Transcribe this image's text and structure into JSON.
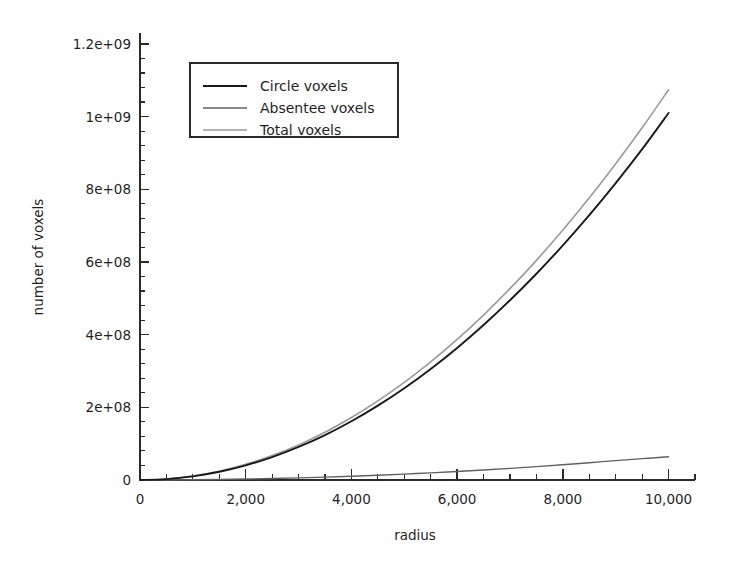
{
  "chart_data": {
    "type": "line",
    "title": "",
    "xlabel": "radius",
    "ylabel": "number of voxels",
    "xlim": [
      0,
      10500
    ],
    "ylim": [
      0,
      1230000000
    ],
    "grid": false,
    "legend_position": "upper left",
    "x_ticks": [
      0,
      2000,
      4000,
      6000,
      8000,
      10000
    ],
    "x_tick_labels": [
      "0",
      "2,000",
      "4,000",
      "6,000",
      "8,000",
      "10,000"
    ],
    "x_minor_per_major": 4,
    "y_ticks": [
      0,
      200000000,
      400000000,
      600000000,
      800000000,
      1000000000,
      1200000000
    ],
    "y_tick_labels": [
      "0",
      "2e+08",
      "4e+08",
      "6e+08",
      "8e+08",
      "1e+09",
      "1.2e+09"
    ],
    "y_minor_per_major": 5,
    "x": [
      0,
      500,
      1000,
      1500,
      2000,
      2500,
      3000,
      3500,
      4000,
      4500,
      5000,
      5500,
      6000,
      6500,
      7000,
      7500,
      8000,
      8500,
      9000,
      9500,
      10000
    ],
    "series": [
      {
        "name": "Circle voxels",
        "color": "#1a1a1a",
        "width": 1.9,
        "values": [
          0,
          2500000,
          10100000,
          22700000,
          40400000,
          63100000,
          90900000,
          123700000,
          161600000,
          204500000,
          252400000,
          305400000,
          363400000,
          426400000,
          494500000,
          567600000,
          645700000,
          728900000,
          817100000,
          910300000,
          1010000000
        ]
      },
      {
        "name": "Absentee voxels",
        "color": "#606060",
        "width": 1.4,
        "values": [
          0,
          200000,
          700000,
          1500000,
          2600000,
          4000000,
          5800000,
          7900000,
          10300000,
          13100000,
          16200000,
          19600000,
          23400000,
          27500000,
          32000000,
          36800000,
          42000000,
          47500000,
          53400000,
          58800000,
          64000000
        ]
      },
      {
        "name": "Total voxels",
        "color": "#9a9a9a",
        "width": 1.6,
        "values": [
          0,
          2700000,
          10800000,
          24200000,
          43000000,
          67100000,
          96700000,
          131600000,
          171900000,
          217600000,
          268600000,
          325000000,
          386800000,
          453900000,
          526500000,
          604400000,
          687700000,
          776400000,
          870500000,
          969100000,
          1074000000
        ]
      }
    ],
    "annotations": []
  },
  "legend": {
    "entries": [
      {
        "label": "Circle voxels"
      },
      {
        "label": "Absentee voxels"
      },
      {
        "label": "Total voxels"
      }
    ]
  }
}
